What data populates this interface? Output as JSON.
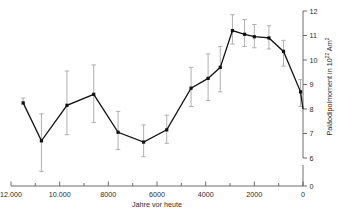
{
  "chart_data": {
    "type": "line",
    "title": "",
    "subtitle": "",
    "xlabel": "Jahre vor heute",
    "ylabel": "Paläodipolmoment in 10²² Am²",
    "ylabel_text": "Paläodipolmoment in 10",
    "ylabel_sup": "22",
    "ylabel_tail": " Am",
    "ylabel_tail_sup": "2",
    "xlim": [
      12000,
      0
    ],
    "xlim_reversed": true,
    "ylim": [
      6,
      12
    ],
    "y_axis_break": true,
    "y_zero_shown": true,
    "grid": false,
    "legend": "none",
    "x_tick_labels": [
      "12.000",
      "10.000",
      "8000",
      "6000",
      "4000",
      "2000",
      "0"
    ],
    "x_tick_values": [
      12000,
      10000,
      8000,
      6000,
      4000,
      2000,
      0
    ],
    "x_minor_tick_values": [
      11000,
      9000,
      7000,
      5000,
      3000,
      1000
    ],
    "y_tick_labels": [
      "0",
      "6",
      "7",
      "8",
      "9",
      "10",
      "11",
      "12"
    ],
    "y_tick_values": [
      0,
      6,
      7,
      8,
      9,
      10,
      11,
      12
    ],
    "error_bar_color": "#b0b0b0",
    "line_color": "#111111",
    "marker_color": "#111111",
    "series": [
      {
        "name": "Paläodipolmoment",
        "x": [
          11500,
          10750,
          9700,
          8600,
          7600,
          6550,
          5600,
          4600,
          3900,
          3400,
          2900,
          2400,
          2000,
          1400,
          800,
          100
        ],
        "values": [
          8.25,
          6.7,
          8.15,
          8.6,
          7.05,
          6.65,
          7.15,
          8.85,
          9.25,
          9.7,
          11.2,
          11.05,
          10.95,
          10.9,
          10.35,
          8.7
        ],
        "err_low": [
          8.2,
          5.45,
          6.95,
          7.45,
          6.35,
          6.05,
          6.6,
          8.1,
          8.35,
          8.7,
          10.65,
          10.55,
          10.5,
          10.45,
          9.75,
          8.1
        ],
        "err_high": [
          8.45,
          7.8,
          9.55,
          9.8,
          7.9,
          7.35,
          7.75,
          9.7,
          10.25,
          10.55,
          11.85,
          11.65,
          11.45,
          11.4,
          10.8,
          9.2
        ]
      }
    ],
    "final_point": {
      "x": 0,
      "value": 8.0
    }
  }
}
